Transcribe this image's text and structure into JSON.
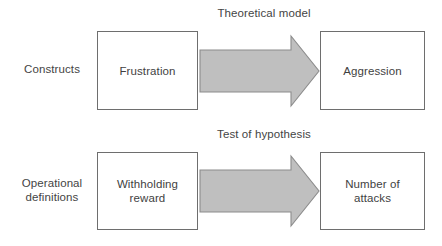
{
  "diagram": {
    "colors": {
      "arrow_fill": "#bfbfbf",
      "arrow_stroke": "#8c8c8c",
      "box_border": "#6e6e6e",
      "background": "#ffffff",
      "text": "#3f3f3f"
    },
    "rows": [
      {
        "id": "constructs",
        "row_label": "Constructs",
        "arrow_label": "Theoretical model",
        "source_box": "Frustration",
        "target_box": "Aggression"
      },
      {
        "id": "operational-definitions",
        "row_label": "Operational\ndefinitions",
        "arrow_label": "Test of hypothesis",
        "source_box": "Withholding\nreward",
        "target_box": "Number of\nattacks"
      }
    ]
  }
}
